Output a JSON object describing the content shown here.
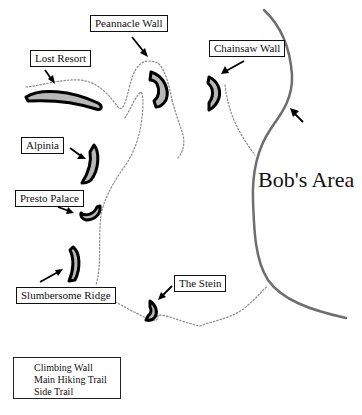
{
  "map": {
    "area_label": "Bob's Area",
    "walls": [
      {
        "name": "Lost Resort"
      },
      {
        "name": "Peannacle Wall"
      },
      {
        "name": "Chainsaw Wall"
      },
      {
        "name": "Alpinia"
      },
      {
        "name": "Presto Palace"
      },
      {
        "name": "Slumbersome Ridge"
      },
      {
        "name": "The Stein"
      }
    ],
    "colors": {
      "wall_fill": "#b8b8b8",
      "wall_stroke": "#000000",
      "main_trail": "#6e6e6e",
      "side_trail": "#8a8a8a"
    }
  },
  "legend": {
    "items": [
      {
        "label": "Climbing Wall",
        "symbol": "climbing-wall"
      },
      {
        "label": "Main Hiking Trail",
        "symbol": "solid-line"
      },
      {
        "label": "Side Trail",
        "symbol": "dotted-line"
      }
    ]
  }
}
